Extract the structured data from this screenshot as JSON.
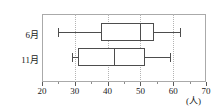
{
  "chart_data": {
    "type": "box",
    "title": "",
    "xlabel": "(人)",
    "ylabel": "",
    "xlim": [
      20,
      70
    ],
    "xticks": [
      20,
      30,
      40,
      50,
      60,
      70
    ],
    "xtick_labels": [
      "20",
      "30",
      "40",
      "50",
      "60",
      "70"
    ],
    "minor_tick_step": 5,
    "grid": "vertical-dotted",
    "grid_values": [
      30,
      40,
      50,
      60
    ],
    "legend": "none",
    "categories": [
      "6月",
      "11月"
    ],
    "series": [
      {
        "name": "6月",
        "min": 25,
        "q1": 38,
        "median": 50,
        "q3": 54,
        "max": 62
      },
      {
        "name": "11月",
        "min": 29,
        "q1": 31,
        "median": 42,
        "q3": 51.5,
        "max": 59
      }
    ],
    "colors": {
      "box_stroke": "#4d4d4d",
      "box_fill": "#ffffff",
      "frame": "#aaaaaa",
      "gridline": "#b4b4b4",
      "axis": "#5a5a5a",
      "text": "#1a1a1a",
      "background": "#ffffff"
    }
  },
  "axis": {
    "unit_label": "(人)"
  }
}
